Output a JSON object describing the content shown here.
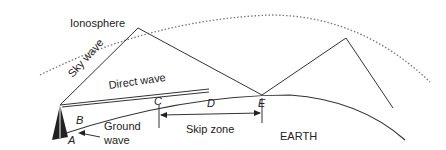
{
  "diagram": {
    "labels": {
      "ionosphere": "Ionosphere",
      "sky_wave": "Sky wave",
      "direct_wave": "Direct wave",
      "ground_wave_line1": "Ground",
      "ground_wave_line2": "wave",
      "skip_zone": "Skip zone",
      "earth": "EARTH",
      "point_a": "A",
      "point_b": "B",
      "point_c": "C",
      "point_d": "D",
      "point_e": "E"
    },
    "colors": {
      "line": "#333333",
      "ionosphere": "#777777",
      "background": "#ffffff"
    }
  }
}
